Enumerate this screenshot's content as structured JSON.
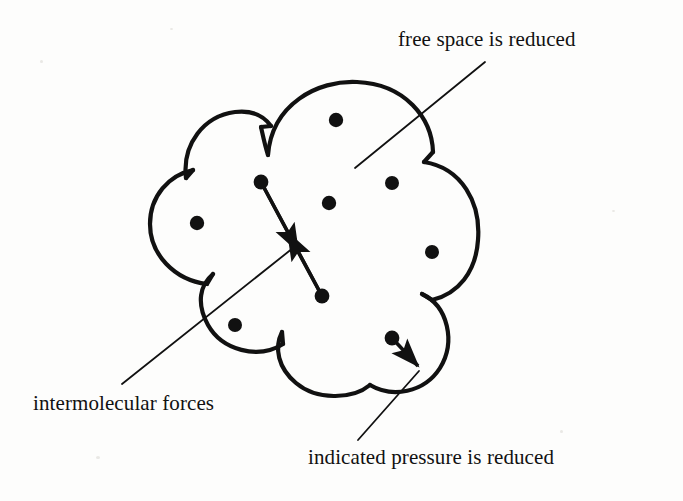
{
  "figure": {
    "background_color": "#fdfdfc",
    "ink_color": "#111111"
  },
  "labels": {
    "free_space": "free space is reduced",
    "intermolecular_forces": "intermolecular forces",
    "indicated_pressure": "indicated pressure is reduced"
  },
  "diagram_data": {
    "type": "diagram",
    "container_shape": "cloud",
    "container_bounds": {
      "x": 145,
      "y": 80,
      "width": 335,
      "height": 310
    },
    "molecules": [
      {
        "id": "molecule-top",
        "x": 336,
        "y": 120,
        "r": 7
      },
      {
        "id": "molecule-upper-right",
        "x": 392,
        "y": 183,
        "r": 7
      },
      {
        "id": "molecule-center",
        "x": 329,
        "y": 203,
        "r": 7
      },
      {
        "id": "molecule-left",
        "x": 197,
        "y": 223,
        "r": 7
      },
      {
        "id": "molecule-right",
        "x": 432,
        "y": 252,
        "r": 7
      },
      {
        "id": "molecule-lower-left",
        "x": 235,
        "y": 325,
        "r": 7
      },
      {
        "id": "molecule-pair-upper",
        "x": 261,
        "y": 182,
        "r": 7
      },
      {
        "id": "molecule-pair-lower",
        "x": 322,
        "y": 296,
        "r": 7
      },
      {
        "id": "molecule-boundary",
        "x": 392,
        "y": 338,
        "r": 7
      }
    ],
    "arrows": [
      {
        "id": "force-arrow",
        "kind": "double-headed",
        "from": {
          "x": 261,
          "y": 182
        },
        "to": {
          "x": 322,
          "y": 296
        },
        "meaning": "intermolecular forces"
      },
      {
        "id": "pressure-arrow",
        "kind": "single-headed",
        "from": {
          "x": 392,
          "y": 338
        },
        "to": {
          "x": 423,
          "y": 372
        },
        "meaning": "indicated pressure is reduced"
      }
    ],
    "leader_lines": [
      {
        "id": "leader-free-space",
        "label": "free space is reduced",
        "from": {
          "x": 485,
          "y": 62
        },
        "to": {
          "x": 355,
          "y": 168
        }
      },
      {
        "id": "leader-intermolecular",
        "label": "intermolecular forces",
        "from": {
          "x": 122,
          "y": 384
        },
        "to": {
          "x": 293,
          "y": 248
        }
      },
      {
        "id": "leader-indicated-pressure",
        "label": "indicated pressure is reduced",
        "from": {
          "x": 358,
          "y": 440
        },
        "to": {
          "x": 419,
          "y": 371
        }
      }
    ]
  }
}
